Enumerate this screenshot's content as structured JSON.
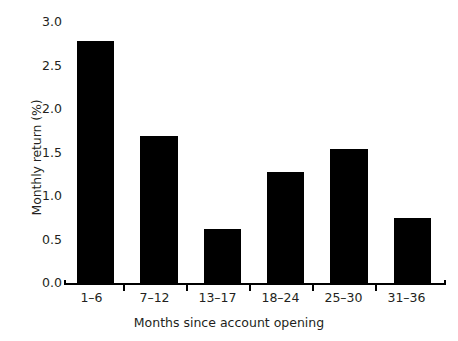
{
  "chart_data": {
    "type": "bar",
    "title": "",
    "subtitle": "",
    "xlabel": "Months since account opening",
    "ylabel": "Monthly return (%)",
    "categories": [
      "1–6",
      "7–12",
      "13–17",
      "18–24",
      "25–30",
      "31–36"
    ],
    "values": [
      2.7,
      1.65,
      0.61,
      1.25,
      1.5,
      0.73
    ],
    "series": [
      {
        "name": "Monthly return",
        "values": [
          2.7,
          1.65,
          0.61,
          1.25,
          1.5,
          0.73
        ]
      }
    ],
    "ylim": [
      0.0,
      3.0
    ],
    "yticks": [
      "0.0",
      "0.5",
      "1.0",
      "1.5",
      "2.0",
      "2.5",
      "3.0"
    ],
    "ytick_values": [
      0.0,
      0.5,
      1.0,
      1.5,
      2.0,
      2.5,
      3.0
    ],
    "grid": false,
    "legend": false,
    "legend_position": "none",
    "bar_color": "#000000",
    "axis_color": "#000000",
    "text_color": "#231f20",
    "background_color": "#ffffff"
  }
}
